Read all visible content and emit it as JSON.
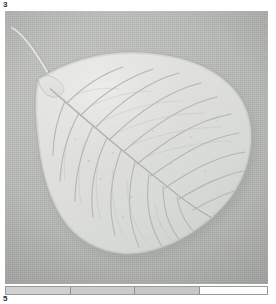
{
  "plate": {
    "number_top": "3",
    "number_bottom": "5",
    "caption_hidden": "Leaf specimen photograph",
    "colors": {
      "page_background": "#ffffff",
      "photo_background": "#b8bab7",
      "leaf_fill": "#dcdedb",
      "leaf_highlight": "#e9eae7",
      "leaf_edge": "#a9aba8",
      "vein_color": "#b0b2af",
      "label_text": "#2b2b2b"
    }
  },
  "photo": {
    "alt": "grayscale photograph of a single broad ovate leaf with long curved petiole, lying on a plain grey background",
    "x": 5,
    "y": 11,
    "width": 263,
    "height": 273
  },
  "specimen": {
    "subject": "leaf",
    "outline_description": "broad ovate to cordate leaf blade, apex drawn into a long narrow acuminate tip at upper left, rounded base at lower centre",
    "petiole_description": "slender curved petiole extending from the blade apex toward the upper left corner",
    "midrib_description": "single midrib running diagonally from upper-left tip to lower-right",
    "lateral_vein_count": 14
  },
  "scale_bar": {
    "name": "tonal-step-wedge",
    "x": 5,
    "y": 286,
    "width": 263,
    "height": 9,
    "segments": [
      {
        "label": "step-1",
        "width_pct": 25.0,
        "color": "#cfd1ce"
      },
      {
        "label": "step-2",
        "width_pct": 24.3,
        "color": "#cbcdca"
      },
      {
        "label": "step-3",
        "width_pct": 25.1,
        "color": "#c6c8c5"
      },
      {
        "label": "step-4",
        "width_pct": 25.6,
        "color": "#fdfdfd"
      }
    ]
  }
}
